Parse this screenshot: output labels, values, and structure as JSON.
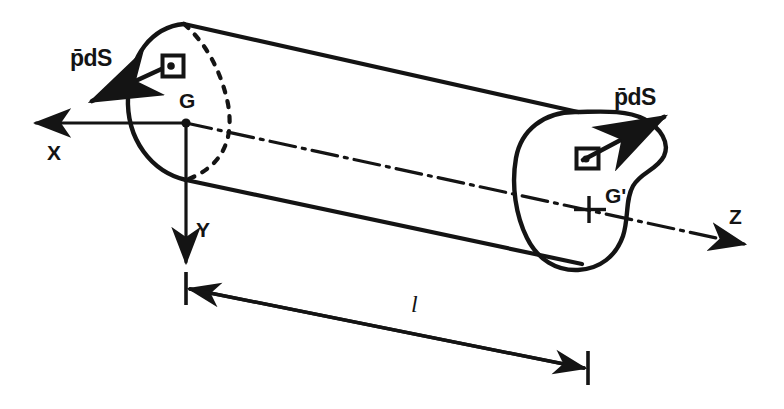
{
  "figure": {
    "type": "engineering-diagram",
    "background_color": "#ffffff",
    "ink_color": "#141414",
    "width": 784,
    "height": 409
  },
  "axes": {
    "x": {
      "label": "X",
      "direction": "left",
      "origin_point": "G"
    },
    "y": {
      "label": "Y",
      "direction": "down",
      "origin_point": "G"
    },
    "z": {
      "label": "Z",
      "direction": "right-down",
      "origin_point": "G"
    }
  },
  "points": {
    "g": {
      "label": "G",
      "description": "centroid of near cross-section"
    },
    "g_prime": {
      "label": "G'",
      "description": "centroid of far cross-section"
    }
  },
  "vectors": {
    "left": {
      "label": "p̄dS",
      "direction": "down-left",
      "description": "pressure force on near face element"
    },
    "right": {
      "label": "p̄dS",
      "direction": "up-right",
      "description": "pressure force on far face element"
    }
  },
  "elements": {
    "left_patch": {
      "name": "dS",
      "shape": "rectangle-with-dot"
    },
    "right_patch": {
      "name": "dS",
      "shape": "rectangle-with-dot"
    }
  },
  "dimension": {
    "label": "l",
    "description": "axial length between the two cross-sections"
  },
  "colors": {
    "ink": "#141414",
    "paper": "#ffffff"
  }
}
